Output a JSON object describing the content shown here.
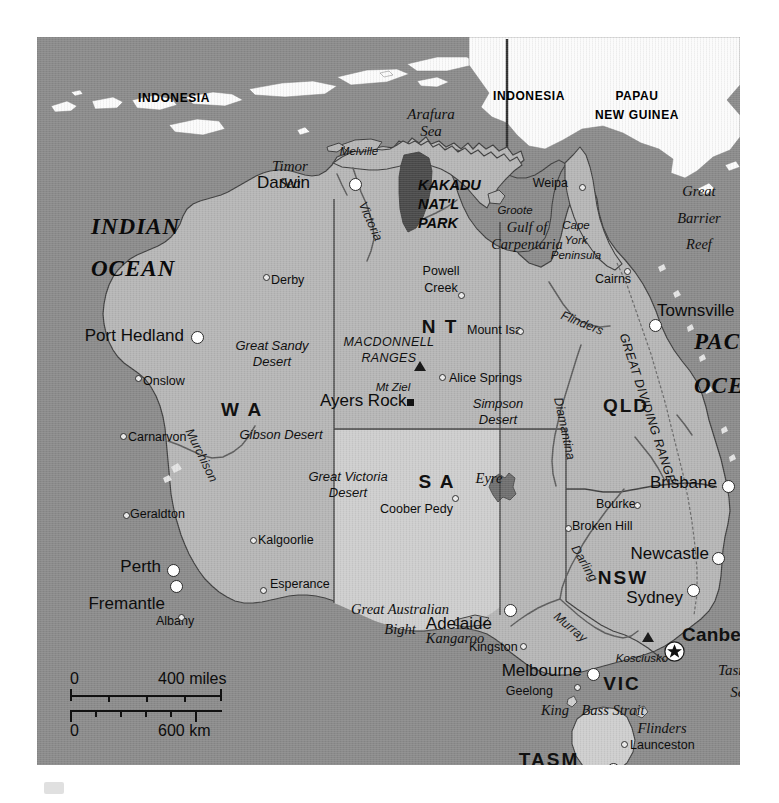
{
  "map": {
    "title": "Australia",
    "colors": {
      "ocean": "#8b8b8b",
      "land": "#b6b6b6",
      "land_light": "#cecece",
      "foreign_land": "#fbfbfb",
      "park": "#4a4a4a",
      "border": "#4a4a4a",
      "river": "#5a5a5a",
      "page": "#ffffff"
    },
    "countries": [
      {
        "name": "INDONESIA",
        "x": 137,
        "y": 55
      },
      {
        "name": "INDONESIA",
        "x": 492,
        "y": 53
      },
      {
        "name": "PAPAU",
        "x": 600,
        "y": 53
      },
      {
        "name": "NEW GUINEA",
        "x": 600,
        "y": 72
      }
    ],
    "oceans": [
      {
        "name": "INDIAN",
        "x": 54,
        "y": 178
      },
      {
        "name": "OCEAN",
        "x": 54,
        "y": 220
      },
      {
        "name": "PACIFIC",
        "x": 657,
        "y": 293
      },
      {
        "name": "OCEAN",
        "x": 657,
        "y": 337
      }
    ],
    "seas": [
      {
        "name": "Arafura",
        "x": 394,
        "y": 70,
        "align": "center"
      },
      {
        "name": "Sea",
        "x": 394,
        "y": 87,
        "align": "center"
      },
      {
        "name": "Timor",
        "x": 253,
        "y": 122,
        "align": "center"
      },
      {
        "name": "Sea",
        "x": 253,
        "y": 139,
        "align": "center"
      },
      {
        "name": "Tasman",
        "x": 704,
        "y": 626,
        "align": "center"
      },
      {
        "name": "Sea",
        "x": 704,
        "y": 648,
        "align": "center"
      }
    ],
    "states": [
      {
        "code": "W A",
        "x": 205,
        "y": 363,
        "size": "lg"
      },
      {
        "code": "N T",
        "x": 403,
        "y": 280,
        "size": "lg"
      },
      {
        "code": "S A",
        "x": 400,
        "y": 435,
        "size": "lg"
      },
      {
        "code": "QLD",
        "x": 589,
        "y": 359,
        "size": "lg"
      },
      {
        "code": "NSW",
        "x": 586,
        "y": 531,
        "size": "lg"
      },
      {
        "code": "VIC",
        "x": 585,
        "y": 637,
        "size": "lg"
      },
      {
        "code": "TASM",
        "x": 512,
        "y": 713,
        "size": "lg"
      }
    ],
    "capital": {
      "name": "Canberra",
      "x": 645,
      "y": 588,
      "marker_x": 637,
      "marker_y": 614
    },
    "cities": [
      {
        "name": "Darwin",
        "lx": 273,
        "ly": 137,
        "align": "right",
        "mx": 318,
        "my": 147,
        "marker": "large",
        "size": "big"
      },
      {
        "name": "Port Hedland",
        "lx": 147,
        "ly": 290,
        "align": "right",
        "mx": 160,
        "my": 300,
        "marker": "large",
        "size": "big"
      },
      {
        "name": "Townsville",
        "lx": 620,
        "ly": 265,
        "align": "left",
        "mx": 618,
        "my": 288,
        "marker": "large",
        "size": "big"
      },
      {
        "name": "Brisbane",
        "lx": 680,
        "ly": 437,
        "align": "right",
        "mx": 691,
        "my": 449,
        "marker": "large",
        "size": "big"
      },
      {
        "name": "Newcastle",
        "lx": 672,
        "ly": 508,
        "align": "right",
        "mx": 681,
        "my": 521,
        "marker": "large",
        "size": "big"
      },
      {
        "name": "Sydney",
        "lx": 646,
        "ly": 552,
        "align": "right",
        "mx": 656,
        "my": 553,
        "marker": "large",
        "size": "big"
      },
      {
        "name": "Perth",
        "lx": 124,
        "ly": 521,
        "align": "right",
        "mx": 136,
        "my": 533,
        "marker": "large",
        "size": "big"
      },
      {
        "name": "Fremantle",
        "lx": 128,
        "ly": 558,
        "align": "right",
        "mx": 139,
        "my": 549,
        "marker": "large",
        "size": "big"
      },
      {
        "name": "Adelaide",
        "lx": 455,
        "ly": 578,
        "align": "right",
        "mx": 473,
        "my": 573,
        "marker": "large",
        "size": "big"
      },
      {
        "name": "Melbourne",
        "lx": 545,
        "ly": 625,
        "align": "right",
        "mx": 556,
        "my": 637,
        "marker": "large",
        "size": "big"
      },
      {
        "name": "Hobart",
        "lx": 572,
        "ly": 744,
        "align": "right",
        "mx": 576,
        "my": 732,
        "marker": "large",
        "size": "big"
      },
      {
        "name": "Weipa",
        "lx": 531,
        "ly": 140,
        "align": "right",
        "mx": 545,
        "my": 150,
        "marker": "small",
        "size": "sm"
      },
      {
        "name": "Derby",
        "lx": 234,
        "ly": 237,
        "align": "left",
        "mx": 229,
        "my": 240,
        "marker": "small",
        "size": "sm"
      },
      {
        "name": "Onslow",
        "lx": 106,
        "ly": 338,
        "align": "left",
        "mx": 101,
        "my": 341,
        "marker": "small",
        "size": "sm"
      },
      {
        "name": "Carnarvon",
        "lx": 91,
        "ly": 394,
        "align": "left",
        "mx": 86,
        "my": 399,
        "marker": "small",
        "size": "sm"
      },
      {
        "name": "Geraldton",
        "lx": 93,
        "ly": 471,
        "align": "left",
        "mx": 89,
        "my": 478,
        "marker": "small",
        "size": "sm"
      },
      {
        "name": "Albany",
        "lx": 119,
        "ly": 578,
        "align": "left",
        "mx": 144,
        "my": 580,
        "marker": "small",
        "size": "sm"
      },
      {
        "name": "Esperance",
        "lx": 233,
        "ly": 541,
        "align": "left",
        "mx": 226,
        "my": 553,
        "marker": "small",
        "size": "sm"
      },
      {
        "name": "Kalgoorlie",
        "lx": 221,
        "ly": 497,
        "align": "left",
        "mx": 216,
        "my": 503,
        "marker": "small",
        "size": "sm"
      },
      {
        "name": "Cairns",
        "lx": 558,
        "ly": 236,
        "align": "left",
        "mx": 590,
        "my": 234,
        "marker": "small",
        "size": "sm"
      },
      {
        "name": "Mount Isa",
        "lx": 430,
        "ly": 287,
        "align": "left",
        "mx": 483,
        "my": 294,
        "marker": "small",
        "size": "sm"
      },
      {
        "name": "Alice Springs",
        "lx": 412,
        "ly": 335,
        "align": "left",
        "mx": 405,
        "my": 340,
        "marker": "small",
        "size": "sm"
      },
      {
        "name": "Coober Pedy",
        "lx": 343,
        "ly": 466,
        "align": "left",
        "mx": 418,
        "my": 461,
        "marker": "small",
        "size": "sm"
      },
      {
        "name": "Bourke",
        "lx": 559,
        "ly": 461,
        "align": "left",
        "mx": 600,
        "my": 468,
        "marker": "small",
        "size": "sm"
      },
      {
        "name": "Broken Hill",
        "lx": 535,
        "ly": 483,
        "align": "left",
        "mx": 531,
        "my": 491,
        "marker": "small",
        "size": "sm"
      },
      {
        "name": "Kingston",
        "lx": 432,
        "ly": 604,
        "align": "left",
        "mx": 486,
        "my": 609,
        "marker": "small",
        "size": "sm"
      },
      {
        "name": "Geelong",
        "lx": 516,
        "ly": 648,
        "align": "right",
        "mx": 540,
        "my": 650,
        "marker": "small",
        "size": "sm"
      },
      {
        "name": "Launceston",
        "lx": 593,
        "ly": 702,
        "align": "left",
        "mx": 587,
        "my": 707,
        "marker": "small",
        "size": "sm"
      }
    ],
    "settlements_two_line": [
      {
        "line1": "Powell",
        "line2": "Creek",
        "lx": 404,
        "ly": 228,
        "mx": 424,
        "my": 258
      }
    ],
    "park": {
      "lines": [
        "KAKADU",
        "NAT'L",
        "PARK"
      ],
      "x": 381,
      "y": 141
    },
    "peaks": [
      {
        "name": "Mt Ziel",
        "lx": 356,
        "ly": 344,
        "mx": 383,
        "my": 333
      },
      {
        "name": "Kosciusko",
        "lx": 605,
        "ly": 615,
        "mx": 611,
        "my": 604
      }
    ],
    "landmarks": [
      {
        "name": "Ayers Rock",
        "lx": 283,
        "ly": 355,
        "mx": 373,
        "my": 365
      }
    ],
    "deserts": [
      {
        "line1": "Great Sandy",
        "line2": "Desert",
        "x": 235,
        "y": 302
      },
      {
        "line1": "Gibson Desert",
        "line2": "",
        "x": 244,
        "y": 391
      },
      {
        "line1": "Great Victoria",
        "line2": "Desert",
        "x": 311,
        "y": 433
      },
      {
        "line1": "Simpson",
        "line2": "Desert",
        "x": 461,
        "y": 360
      }
    ],
    "physical": [
      {
        "name": "Melville",
        "x": 322,
        "y": 108,
        "style": "phys-sm"
      },
      {
        "name": "Groote",
        "x": 478,
        "y": 167,
        "style": "phys-sm"
      },
      {
        "name": "Gulf of",
        "x": 490,
        "y": 183,
        "style": "phys-ser"
      },
      {
        "name": "Carpentaria",
        "x": 490,
        "y": 200,
        "style": "phys-ser"
      },
      {
        "name": "Cape",
        "x": 539,
        "y": 182,
        "style": "phys-sm"
      },
      {
        "name": "York",
        "x": 539,
        "y": 197,
        "style": "phys-sm"
      },
      {
        "name": "Peninsula",
        "x": 539,
        "y": 212,
        "style": "phys-sm"
      },
      {
        "name": "Great",
        "x": 662,
        "y": 147,
        "style": "phys-ser"
      },
      {
        "name": "Barrier",
        "x": 662,
        "y": 174,
        "style": "phys-ser"
      },
      {
        "name": "Reef",
        "x": 662,
        "y": 200,
        "style": "phys-ser"
      },
      {
        "name": "Eyre",
        "x": 452,
        "y": 434,
        "style": "phys-ser"
      },
      {
        "name": "Kangaroo",
        "x": 418,
        "y": 594,
        "style": "phys-ser"
      },
      {
        "name": "King",
        "x": 518,
        "y": 666,
        "style": "phys-ser"
      },
      {
        "name": "Bass Strait",
        "x": 576,
        "y": 666,
        "style": "phys-ser"
      },
      {
        "name": "Flinders",
        "x": 625,
        "y": 684,
        "style": "phys-ser"
      },
      {
        "name": "Tasmania",
        "x": 620,
        "y": 726,
        "style": "phys-ser-lg"
      },
      {
        "name": "Great Australian",
        "x": 363,
        "y": 565,
        "style": "phys-ser"
      },
      {
        "name": "Bight",
        "x": 363,
        "y": 585,
        "style": "phys-ser"
      }
    ],
    "rivers": [
      {
        "name": "Victoria",
        "x": 333,
        "y": 178,
        "rot": 66
      },
      {
        "name": "Murchison",
        "x": 164,
        "y": 412,
        "rot": 64
      },
      {
        "name": "Flinders",
        "x": 545,
        "y": 280,
        "rot": 22
      },
      {
        "name": "Diamantina",
        "x": 527,
        "y": 385,
        "rot": 78
      },
      {
        "name": "Darling",
        "x": 547,
        "y": 520,
        "rot": 60
      },
      {
        "name": "Murray",
        "x": 533,
        "y": 584,
        "rot": 40
      }
    ],
    "ranges": [
      {
        "line1": "MACDONNELL",
        "line2": "RANGES",
        "x": 352,
        "y": 299,
        "rot": 0
      },
      {
        "name": "GREAT DIVIDING RANGE",
        "x": 610,
        "y": 365,
        "rot": 72
      }
    ],
    "scale": {
      "miles_zero": "0",
      "miles_label": "400 miles",
      "km_zero": "0",
      "km_label": "600 km"
    }
  }
}
